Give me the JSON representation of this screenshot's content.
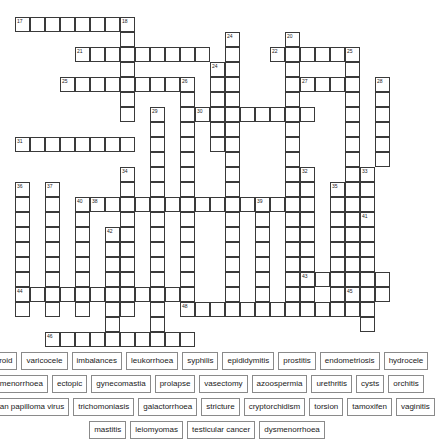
{
  "puzzle": {
    "type": "crossword",
    "title": "Crossword Puzzle",
    "cell_size": 15,
    "grid_origin": {
      "x": 15,
      "y": 17
    },
    "entries": [
      {
        "number": "17",
        "direction": "across",
        "col": 0,
        "row": 0,
        "length": 8
      },
      {
        "number": "18",
        "direction": "down",
        "col": 7,
        "row": 0,
        "length": 5
      },
      {
        "number": "21",
        "direction": "across",
        "col": 4,
        "row": 2,
        "length": 9
      },
      {
        "number": "22",
        "direction": "down",
        "col": 13,
        "row": 2,
        "length": 4
      },
      {
        "number": "24",
        "direction": "down",
        "col": 14,
        "row": 1,
        "length": 8
      },
      {
        "number": "20",
        "direction": "down",
        "col": 18,
        "row": 1,
        "length": 10
      },
      {
        "number": "23",
        "direction": "across",
        "col": 17,
        "row": 2,
        "length": 7
      },
      {
        "number": "25",
        "direction": "down",
        "col": 22,
        "row": 2,
        "length": 9
      },
      {
        "number": "25b",
        "direction": "across",
        "col": 3,
        "row": 4,
        "length": 9
      },
      {
        "number": "26",
        "direction": "down",
        "col": 11,
        "row": 4,
        "length": 6
      },
      {
        "number": "27",
        "direction": "across",
        "col": 19,
        "row": 4,
        "length": 4
      },
      {
        "number": "28",
        "direction": "down",
        "col": 24,
        "row": 4,
        "length": 7
      },
      {
        "number": "29",
        "direction": "down",
        "col": 9,
        "row": 6,
        "length": 11
      },
      {
        "number": "30",
        "direction": "across",
        "col": 12,
        "row": 6,
        "length": 8
      },
      {
        "number": "31",
        "direction": "across",
        "col": 0,
        "row": 8,
        "length": 8
      },
      {
        "number": "32",
        "direction": "down",
        "col": 19,
        "row": 10,
        "length": 9
      },
      {
        "number": "33",
        "direction": "down",
        "col": 23,
        "row": 10,
        "length": 10
      },
      {
        "number": "34",
        "direction": "down",
        "col": 7,
        "row": 10,
        "length": 9
      },
      {
        "number": "35",
        "direction": "down",
        "col": 21,
        "row": 11,
        "length": 9
      },
      {
        "number": "36",
        "direction": "down",
        "col": 0,
        "row": 11,
        "length": 9
      },
      {
        "number": "37",
        "direction": "down",
        "col": 2,
        "row": 11,
        "length": 9
      },
      {
        "number": "38",
        "direction": "across",
        "col": 5,
        "row": 12,
        "length": 12
      },
      {
        "number": "39",
        "direction": "down",
        "col": 16,
        "row": 12,
        "length": 8
      },
      {
        "number": "40",
        "direction": "down",
        "col": 4,
        "row": 12,
        "length": 8
      },
      {
        "number": "41",
        "direction": "down",
        "col": 23,
        "row": 13,
        "length": 8
      },
      {
        "number": "42",
        "direction": "down",
        "col": 6,
        "row": 14,
        "length": 10
      },
      {
        "number": "43",
        "direction": "across",
        "col": 19,
        "row": 17,
        "length": 6
      },
      {
        "number": "44",
        "direction": "across",
        "col": 0,
        "row": 18,
        "length": 11
      },
      {
        "number": "45",
        "direction": "across",
        "col": 22,
        "row": 18,
        "length": 3
      },
      {
        "number": "46",
        "direction": "across",
        "col": 2,
        "row": 21,
        "length": 10
      },
      {
        "number": "48",
        "direction": "across",
        "col": 11,
        "row": 19,
        "length": 12
      }
    ],
    "cells": [
      {
        "c": 0,
        "r": 0,
        "n": "17"
      },
      {
        "c": 1,
        "r": 0
      },
      {
        "c": 2,
        "r": 0
      },
      {
        "c": 3,
        "r": 0
      },
      {
        "c": 4,
        "r": 0
      },
      {
        "c": 5,
        "r": 0
      },
      {
        "c": 6,
        "r": 0
      },
      {
        "c": 7,
        "r": 0,
        "n": "18"
      },
      {
        "c": 7,
        "r": 1
      },
      {
        "c": 4,
        "r": 2,
        "n": "21"
      },
      {
        "c": 5,
        "r": 2
      },
      {
        "c": 6,
        "r": 2
      },
      {
        "c": 7,
        "r": 2
      },
      {
        "c": 8,
        "r": 2
      },
      {
        "c": 9,
        "r": 2
      },
      {
        "c": 10,
        "r": 2
      },
      {
        "c": 11,
        "r": 2
      },
      {
        "c": 12,
        "r": 2
      },
      {
        "c": 14,
        "r": 1,
        "n": "24"
      },
      {
        "c": 18,
        "r": 1,
        "n": "20"
      },
      {
        "c": 17,
        "r": 2,
        "n": "22"
      },
      {
        "c": 18,
        "r": 2
      },
      {
        "c": 19,
        "r": 2
      },
      {
        "c": 20,
        "r": 2
      },
      {
        "c": 21,
        "r": 2
      },
      {
        "c": 22,
        "r": 2,
        "n": "25"
      },
      {
        "c": 7,
        "r": 3
      },
      {
        "c": 14,
        "r": 2
      },
      {
        "c": 14,
        "r": 3
      },
      {
        "c": 18,
        "r": 3
      },
      {
        "c": 22,
        "r": 3
      },
      {
        "c": 13,
        "r": 3,
        "n": "24b"
      },
      {
        "c": 3,
        "r": 4,
        "n": "25b"
      },
      {
        "c": 4,
        "r": 4
      },
      {
        "c": 5,
        "r": 4
      },
      {
        "c": 6,
        "r": 4
      },
      {
        "c": 7,
        "r": 4
      },
      {
        "c": 8,
        "r": 4
      },
      {
        "c": 9,
        "r": 4
      },
      {
        "c": 10,
        "r": 4
      },
      {
        "c": 11,
        "r": 4,
        "n": "26"
      },
      {
        "c": 13,
        "r": 4
      },
      {
        "c": 14,
        "r": 4
      },
      {
        "c": 18,
        "r": 4
      },
      {
        "c": 19,
        "r": 4,
        "n": "27"
      },
      {
        "c": 20,
        "r": 4
      },
      {
        "c": 21,
        "r": 4
      },
      {
        "c": 22,
        "r": 4
      },
      {
        "c": 24,
        "r": 4,
        "n": "28"
      },
      {
        "c": 7,
        "r": 5
      },
      {
        "c": 11,
        "r": 5
      },
      {
        "c": 13,
        "r": 5
      },
      {
        "c": 14,
        "r": 5
      },
      {
        "c": 18,
        "r": 5
      },
      {
        "c": 22,
        "r": 5
      },
      {
        "c": 24,
        "r": 5
      },
      {
        "c": 7,
        "r": 6
      },
      {
        "c": 9,
        "r": 6,
        "n": "29"
      },
      {
        "c": 11,
        "r": 6
      },
      {
        "c": 12,
        "r": 6,
        "n": "30"
      },
      {
        "c": 13,
        "r": 6
      },
      {
        "c": 14,
        "r": 6
      },
      {
        "c": 15,
        "r": 6
      },
      {
        "c": 16,
        "r": 6
      },
      {
        "c": 17,
        "r": 6
      },
      {
        "c": 18,
        "r": 6
      },
      {
        "c": 19,
        "r": 6
      },
      {
        "c": 22,
        "r": 6
      },
      {
        "c": 24,
        "r": 6
      },
      {
        "c": 9,
        "r": 7
      },
      {
        "c": 11,
        "r": 7
      },
      {
        "c": 13,
        "r": 7
      },
      {
        "c": 14,
        "r": 7
      },
      {
        "c": 18,
        "r": 7
      },
      {
        "c": 22,
        "r": 7
      },
      {
        "c": 24,
        "r": 7
      },
      {
        "c": 0,
        "r": 8,
        "n": "31"
      },
      {
        "c": 1,
        "r": 8
      },
      {
        "c": 2,
        "r": 8
      },
      {
        "c": 3,
        "r": 8
      },
      {
        "c": 4,
        "r": 8
      },
      {
        "c": 5,
        "r": 8
      },
      {
        "c": 6,
        "r": 8
      },
      {
        "c": 7,
        "r": 8
      },
      {
        "c": 9,
        "r": 8
      },
      {
        "c": 11,
        "r": 8
      },
      {
        "c": 13,
        "r": 8
      },
      {
        "c": 14,
        "r": 8
      },
      {
        "c": 18,
        "r": 8
      },
      {
        "c": 22,
        "r": 8
      },
      {
        "c": 24,
        "r": 8
      },
      {
        "c": 9,
        "r": 9
      },
      {
        "c": 11,
        "r": 9
      },
      {
        "c": 14,
        "r": 9
      },
      {
        "c": 18,
        "r": 9
      },
      {
        "c": 22,
        "r": 9
      },
      {
        "c": 24,
        "r": 9
      },
      {
        "c": 7,
        "r": 10,
        "n": "34"
      },
      {
        "c": 9,
        "r": 10
      },
      {
        "c": 11,
        "r": 10
      },
      {
        "c": 14,
        "r": 10
      },
      {
        "c": 18,
        "r": 10
      },
      {
        "c": 19,
        "r": 10,
        "n": "32"
      },
      {
        "c": 22,
        "r": 10
      },
      {
        "c": 23,
        "r": 10,
        "n": "33"
      },
      {
        "c": 0,
        "r": 11,
        "n": "36"
      },
      {
        "c": 2,
        "r": 11,
        "n": "37"
      },
      {
        "c": 5,
        "r": 12,
        "n": "38"
      },
      {
        "c": 6,
        "r": 12
      },
      {
        "c": 7,
        "r": 11
      },
      {
        "c": 9,
        "r": 11
      },
      {
        "c": 11,
        "r": 11
      },
      {
        "c": 14,
        "r": 11
      },
      {
        "c": 16,
        "r": 12,
        "n": "39"
      },
      {
        "c": 18,
        "r": 11
      },
      {
        "c": 19,
        "r": 11
      },
      {
        "c": 21,
        "r": 11,
        "n": "35"
      },
      {
        "c": 22,
        "r": 11
      },
      {
        "c": 23,
        "r": 11
      },
      {
        "c": 0,
        "r": 12
      },
      {
        "c": 2,
        "r": 12
      },
      {
        "c": 4,
        "r": 12,
        "n": "40"
      },
      {
        "c": 7,
        "r": 12
      },
      {
        "c": 8,
        "r": 12
      },
      {
        "c": 9,
        "r": 12
      },
      {
        "c": 10,
        "r": 12
      },
      {
        "c": 11,
        "r": 12
      },
      {
        "c": 12,
        "r": 12
      },
      {
        "c": 13,
        "r": 12
      },
      {
        "c": 14,
        "r": 12
      },
      {
        "c": 15,
        "r": 12
      },
      {
        "c": 17,
        "r": 12
      },
      {
        "c": 18,
        "r": 12
      },
      {
        "c": 19,
        "r": 12
      },
      {
        "c": 21,
        "r": 12
      },
      {
        "c": 22,
        "r": 12
      },
      {
        "c": 23,
        "r": 12
      },
      {
        "c": 0,
        "r": 13
      },
      {
        "c": 2,
        "r": 13
      },
      {
        "c": 4,
        "r": 13
      },
      {
        "c": 7,
        "r": 13
      },
      {
        "c": 9,
        "r": 13
      },
      {
        "c": 11,
        "r": 13
      },
      {
        "c": 14,
        "r": 13
      },
      {
        "c": 16,
        "r": 13
      },
      {
        "c": 18,
        "r": 13
      },
      {
        "c": 19,
        "r": 13
      },
      {
        "c": 21,
        "r": 13
      },
      {
        "c": 22,
        "r": 13
      },
      {
        "c": 23,
        "r": 13,
        "n": "41"
      },
      {
        "c": 0,
        "r": 14
      },
      {
        "c": 2,
        "r": 14
      },
      {
        "c": 4,
        "r": 14
      },
      {
        "c": 6,
        "r": 14,
        "n": "42"
      },
      {
        "c": 7,
        "r": 14
      },
      {
        "c": 9,
        "r": 14
      },
      {
        "c": 11,
        "r": 14
      },
      {
        "c": 14,
        "r": 14
      },
      {
        "c": 16,
        "r": 14
      },
      {
        "c": 18,
        "r": 14
      },
      {
        "c": 19,
        "r": 14
      },
      {
        "c": 21,
        "r": 14
      },
      {
        "c": 22,
        "r": 14
      },
      {
        "c": 23,
        "r": 14
      },
      {
        "c": 0,
        "r": 15
      },
      {
        "c": 2,
        "r": 15
      },
      {
        "c": 4,
        "r": 15
      },
      {
        "c": 6,
        "r": 15
      },
      {
        "c": 7,
        "r": 15
      },
      {
        "c": 9,
        "r": 15
      },
      {
        "c": 11,
        "r": 15
      },
      {
        "c": 14,
        "r": 15
      },
      {
        "c": 16,
        "r": 15
      },
      {
        "c": 18,
        "r": 15
      },
      {
        "c": 19,
        "r": 15
      },
      {
        "c": 21,
        "r": 15
      },
      {
        "c": 22,
        "r": 15
      },
      {
        "c": 23,
        "r": 15
      },
      {
        "c": 0,
        "r": 16
      },
      {
        "c": 2,
        "r": 16
      },
      {
        "c": 4,
        "r": 16
      },
      {
        "c": 6,
        "r": 16
      },
      {
        "c": 7,
        "r": 16
      },
      {
        "c": 9,
        "r": 16
      },
      {
        "c": 11,
        "r": 16
      },
      {
        "c": 14,
        "r": 16
      },
      {
        "c": 16,
        "r": 16
      },
      {
        "c": 18,
        "r": 16
      },
      {
        "c": 19,
        "r": 16
      },
      {
        "c": 21,
        "r": 16
      },
      {
        "c": 22,
        "r": 16
      },
      {
        "c": 23,
        "r": 16
      },
      {
        "c": 0,
        "r": 17
      },
      {
        "c": 2,
        "r": 17
      },
      {
        "c": 4,
        "r": 17
      },
      {
        "c": 6,
        "r": 17
      },
      {
        "c": 7,
        "r": 17
      },
      {
        "c": 9,
        "r": 17
      },
      {
        "c": 11,
        "r": 17
      },
      {
        "c": 14,
        "r": 17
      },
      {
        "c": 16,
        "r": 17
      },
      {
        "c": 18,
        "r": 17
      },
      {
        "c": 19,
        "r": 17,
        "n": "43"
      },
      {
        "c": 20,
        "r": 17
      },
      {
        "c": 21,
        "r": 17
      },
      {
        "c": 22,
        "r": 17
      },
      {
        "c": 23,
        "r": 17
      },
      {
        "c": 24,
        "r": 17
      },
      {
        "c": 0,
        "r": 18,
        "n": "44"
      },
      {
        "c": 1,
        "r": 18
      },
      {
        "c": 2,
        "r": 18
      },
      {
        "c": 3,
        "r": 18
      },
      {
        "c": 4,
        "r": 18
      },
      {
        "c": 5,
        "r": 18
      },
      {
        "c": 6,
        "r": 18
      },
      {
        "c": 7,
        "r": 18
      },
      {
        "c": 8,
        "r": 18
      },
      {
        "c": 9,
        "r": 18
      },
      {
        "c": 10,
        "r": 18
      },
      {
        "c": 11,
        "r": 18
      },
      {
        "c": 14,
        "r": 18
      },
      {
        "c": 16,
        "r": 18
      },
      {
        "c": 18,
        "r": 18
      },
      {
        "c": 19,
        "r": 18
      },
      {
        "c": 21,
        "r": 18
      },
      {
        "c": 22,
        "r": 18,
        "n": "45"
      },
      {
        "c": 23,
        "r": 18
      },
      {
        "c": 24,
        "r": 18
      },
      {
        "c": 0,
        "r": 19
      },
      {
        "c": 2,
        "r": 19
      },
      {
        "c": 4,
        "r": 19
      },
      {
        "c": 6,
        "r": 19
      },
      {
        "c": 7,
        "r": 19
      },
      {
        "c": 9,
        "r": 19
      },
      {
        "c": 11,
        "r": 19,
        "n": "48"
      },
      {
        "c": 12,
        "r": 19
      },
      {
        "c": 13,
        "r": 19
      },
      {
        "c": 14,
        "r": 19
      },
      {
        "c": 15,
        "r": 19
      },
      {
        "c": 16,
        "r": 19
      },
      {
        "c": 17,
        "r": 19
      },
      {
        "c": 18,
        "r": 19
      },
      {
        "c": 19,
        "r": 19
      },
      {
        "c": 20,
        "r": 19
      },
      {
        "c": 21,
        "r": 19
      },
      {
        "c": 22,
        "r": 19
      },
      {
        "c": 23,
        "r": 19
      },
      {
        "c": 6,
        "r": 20
      },
      {
        "c": 9,
        "r": 20
      },
      {
        "c": 23,
        "r": 20
      },
      {
        "c": 2,
        "r": 21,
        "n": "46"
      },
      {
        "c": 3,
        "r": 21
      },
      {
        "c": 4,
        "r": 21
      },
      {
        "c": 5,
        "r": 21
      },
      {
        "c": 6,
        "r": 21
      },
      {
        "c": 7,
        "r": 21
      },
      {
        "c": 8,
        "r": 21
      },
      {
        "c": 9,
        "r": 21
      },
      {
        "c": 10,
        "r": 21
      },
      {
        "c": 11,
        "r": 21
      }
    ]
  },
  "word_bank": {
    "rows": [
      [
        "fibroid",
        "varicocele",
        "imbalances",
        "leukorrhoea",
        "syphilis",
        "epididymitis",
        "prostitis",
        "endometriosis",
        "hydrocele"
      ],
      [
        "amenorrhoea",
        "ectopic",
        "gynecomastia",
        "prolapse",
        "vasectomy",
        "azoospermia",
        "urethritis",
        "cysts",
        "orchitis"
      ],
      [
        "human papilloma virus",
        "trichomoniasis",
        "galactorrhoea",
        "stricture",
        "cryptorchidism",
        "torsion",
        "tamoxifen",
        "vaginitis"
      ],
      [
        "mastitis",
        "leiomyomas",
        "testicular cancer",
        "dysmenorrhoea"
      ]
    ]
  },
  "colors": {
    "cell_border": "#3a3a3a",
    "word_border": "#8a8a8a",
    "background": "#ffffff",
    "text": "#1a1a1a"
  }
}
